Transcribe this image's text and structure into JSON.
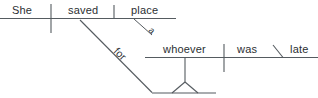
{
  "diagram": {
    "type": "reed-kellogg-sentence-diagram",
    "sentence": "She saved a place for whoever was late",
    "ink_color": "#555b60",
    "text_color": "#2b2f33",
    "background_color": "#ffffff",
    "main_clause": {
      "subject": "She",
      "verb": "saved",
      "direct_object": "place",
      "object_modifier": "a"
    },
    "prepositional_phrase": {
      "preposition": "for"
    },
    "subordinate_clause": {
      "subject": "whoever",
      "verb": "was",
      "predicate_adjective": "late"
    }
  }
}
